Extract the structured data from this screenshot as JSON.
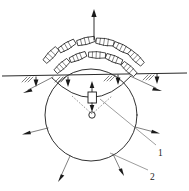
{
  "figure": {
    "type": "engineering-schematic",
    "colors": {
      "stroke": "#1a1a1a",
      "ground": "#2b2b2b",
      "leader": "#5a5a5a",
      "background": "#ffffff"
    },
    "callouts": [
      {
        "id": "callout-1",
        "label": "1",
        "x": 160,
        "y": 150
      },
      {
        "id": "callout-2",
        "label": "2",
        "x": 152,
        "y": 173
      }
    ],
    "ground_line": {
      "name": "ground-surface-line",
      "x1": 2,
      "y1": 76,
      "x2": 187,
      "y2": 73
    },
    "blast_circle": {
      "name": "blast-zone-circle",
      "cx": 91,
      "cy": 115,
      "r": 46
    },
    "charge": {
      "name": "charge-symbol",
      "cx": 92,
      "cy": 97,
      "w": 8,
      "h": 11
    },
    "hub": {
      "name": "center-hub",
      "cx": 92,
      "cy": 115,
      "r": 3.2
    },
    "vertical_arrow": {
      "name": "ejection-axis-arrow",
      "x": 94,
      "y_top": 10,
      "y_bottom": 40
    },
    "fragments_outer": [
      {
        "cx": 51,
        "cy": 55,
        "rot": -47
      },
      {
        "cx": 67,
        "cy": 46,
        "rot": -31
      },
      {
        "cx": 86,
        "cy": 41,
        "rot": -14
      },
      {
        "cx": 105,
        "cy": 42,
        "rot": 9
      },
      {
        "cx": 122,
        "cy": 48,
        "rot": 27
      },
      {
        "cx": 136,
        "cy": 58,
        "rot": 44
      }
    ],
    "fragments_inner": [
      {
        "cx": 62,
        "cy": 66,
        "rot": -42
      },
      {
        "cx": 78,
        "cy": 57,
        "rot": -22
      },
      {
        "cx": 97,
        "cy": 55,
        "rot": 3
      },
      {
        "cx": 114,
        "cy": 59,
        "rot": 22
      },
      {
        "cx": 129,
        "cy": 69,
        "rot": 42
      }
    ],
    "radial_arrows": [
      {
        "name": "radial-arrow-upper-left",
        "x1": 53,
        "y1": 76,
        "x2": 24,
        "y2": 92
      },
      {
        "name": "radial-arrow-upper-right",
        "x1": 130,
        "y1": 75,
        "x2": 161,
        "y2": 90
      },
      {
        "name": "radial-arrow-left",
        "x1": 48,
        "y1": 128,
        "x2": 22,
        "y2": 134
      },
      {
        "name": "radial-arrow-right",
        "x1": 135,
        "y1": 127,
        "x2": 160,
        "y2": 133
      },
      {
        "name": "radial-arrow-lower-left",
        "x1": 70,
        "y1": 156,
        "x2": 58,
        "y2": 182
      },
      {
        "name": "radial-arrow-lower-right",
        "x1": 113,
        "y1": 154,
        "x2": 124,
        "y2": 176
      }
    ],
    "surface_load_arrows": [
      {
        "name": "surface-arrow-1",
        "x": 36,
        "y": 76
      },
      {
        "name": "surface-arrow-2",
        "x": 68,
        "y": 76
      },
      {
        "name": "surface-arrow-3",
        "x": 118,
        "y": 74
      },
      {
        "name": "surface-arrow-4",
        "x": 157,
        "y": 73
      }
    ],
    "hatch_groups": [
      {
        "name": "hatch-group-1",
        "x": 24,
        "y": 76
      },
      {
        "name": "hatch-group-2",
        "x": 57,
        "y": 76
      },
      {
        "name": "hatch-group-3",
        "x": 106,
        "y": 75
      },
      {
        "name": "hatch-group-4",
        "x": 145,
        "y": 74
      }
    ]
  }
}
